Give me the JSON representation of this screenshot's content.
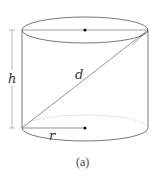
{
  "figure": {
    "caption": "(a)",
    "shape": "cylinder",
    "labels": {
      "height": "h",
      "diagonal": "d",
      "radius": "r"
    },
    "colors": {
      "stroke": "#555555",
      "hidden_edge": "#aaaaaa",
      "center_dot": "#111111",
      "background": "#ffffff"
    }
  }
}
